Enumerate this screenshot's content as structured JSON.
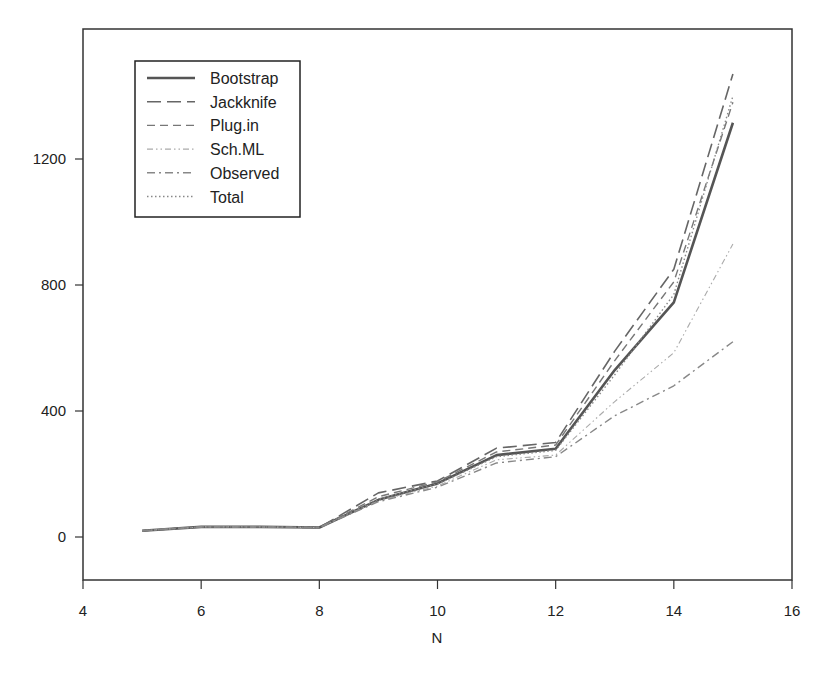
{
  "chart_data": {
    "type": "line",
    "title": "",
    "xlabel": "N",
    "ylabel": "",
    "xlim": [
      4,
      16
    ],
    "ylim": [
      -140,
      1760
    ],
    "xticks": [
      4,
      6,
      8,
      10,
      12,
      14,
      16
    ],
    "yticks": [
      0,
      400,
      800,
      1200
    ],
    "grid": false,
    "legend_position": "upper-left",
    "x": [
      5,
      6,
      7,
      8,
      9,
      10,
      11,
      12,
      13,
      14,
      15
    ],
    "series": [
      {
        "name": "Bootstrap",
        "style": "solid",
        "values": [
          20,
          32,
          32,
          30,
          118,
          170,
          260,
          280,
          530,
          745,
          1315
        ]
      },
      {
        "name": "Jackknife",
        "style": "longdash",
        "values": [
          20,
          32,
          32,
          30,
          140,
          178,
          282,
          300,
          590,
          850,
          1470
        ]
      },
      {
        "name": "Plug.in",
        "style": "dash",
        "values": [
          20,
          32,
          32,
          30,
          128,
          175,
          270,
          292,
          560,
          810,
          1380
        ]
      },
      {
        "name": "Sch.ML",
        "style": "dashdotdot",
        "values": [
          20,
          32,
          32,
          30,
          115,
          162,
          245,
          260,
          430,
          585,
          930
        ]
      },
      {
        "name": "Observed",
        "style": "dashdot",
        "values": [
          20,
          32,
          32,
          30,
          112,
          158,
          235,
          255,
          385,
          480,
          620
        ]
      },
      {
        "name": "Total",
        "style": "dotted",
        "values": [
          20,
          32,
          32,
          30,
          120,
          168,
          255,
          275,
          515,
          770,
          1400
        ]
      }
    ]
  }
}
